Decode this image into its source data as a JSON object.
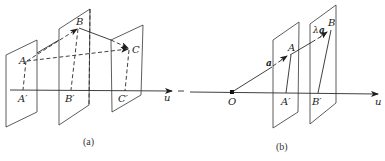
{
  "figure_a": {
    "caption": "(a)",
    "points": {
      "A": "A",
      "B": "B",
      "C": "C",
      "A_proj": "A′",
      "B_proj": "B′",
      "C_proj": "C′"
    },
    "axis_label": "u"
  },
  "figure_b": {
    "caption": "(b)",
    "points": {
      "O": "O",
      "A": "A",
      "B": "B",
      "A_proj": "A′",
      "B_proj": "B′"
    },
    "vector_a": "a",
    "vector_lambda_a_prefix": "λ",
    "vector_lambda_a": "a",
    "axis_label": "u"
  },
  "colors": {
    "line": "#2a2a2a",
    "background": "#ffffff"
  }
}
